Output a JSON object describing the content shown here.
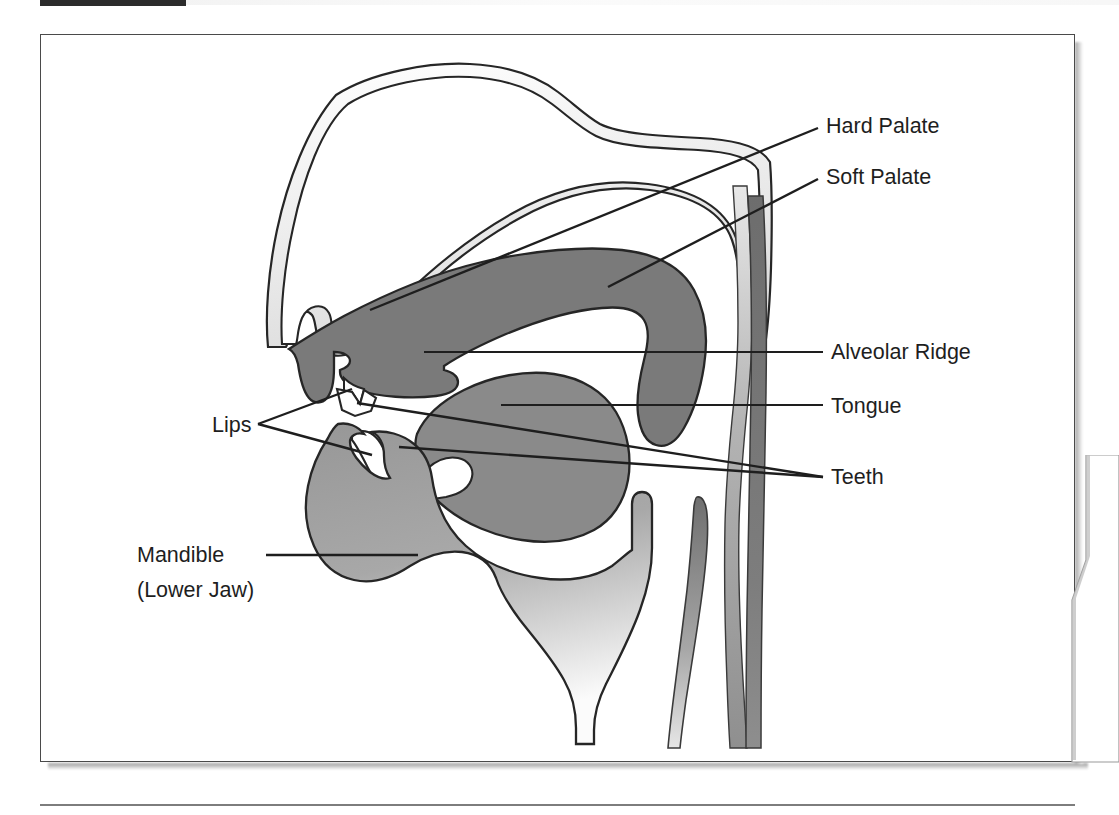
{
  "figure": {
    "kind": "anatomical-diagram"
  },
  "marker_bar": {
    "present": true,
    "color": "#2b2b2b"
  },
  "colors": {
    "outline": "#262626",
    "palate_dark_gray": "#7a7a7a",
    "tongue_gray": "#8a8a8a",
    "mandible_gray": "#9e9e9e",
    "nasal_light_gray": "#e2e2e2",
    "pharynx_gray": "#a8a8a8",
    "label_text": "#1e1e1e",
    "frame": "#4a4a4a",
    "page_background": "#ffffff"
  },
  "labels": [
    {
      "id": "hard-palate",
      "text": "Hard Palate",
      "x": 826,
      "y": 133,
      "anchor": "start"
    },
    {
      "id": "soft-palate",
      "text": "Soft Palate",
      "x": 826,
      "y": 184,
      "anchor": "start"
    },
    {
      "id": "alveolar-ridge",
      "text": "Alveolar Ridge",
      "x": 831,
      "y": 359,
      "anchor": "start"
    },
    {
      "id": "tongue",
      "text": "Tongue",
      "x": 831,
      "y": 413,
      "anchor": "start"
    },
    {
      "id": "teeth",
      "text": "Teeth",
      "x": 831,
      "y": 484,
      "anchor": "start"
    },
    {
      "id": "lips",
      "text": "Lips",
      "x": 212,
      "y": 432,
      "anchor": "start"
    },
    {
      "id": "mandible",
      "text": "Mandible",
      "x": 137,
      "y": 562,
      "anchor": "start"
    },
    {
      "id": "mandible-sub",
      "text": "(Lower Jaw)",
      "x": 137,
      "y": 597,
      "anchor": "start"
    }
  ],
  "leader_lines": [
    {
      "id": "hard-palate-leader",
      "points": "818,128 370,310"
    },
    {
      "id": "soft-palate-leader",
      "points": "818,179 608,287"
    },
    {
      "id": "alveolar-ridge-leader",
      "points": "823,352 424,352"
    },
    {
      "id": "tongue-leader",
      "points": "823,405 501,405"
    },
    {
      "id": "teeth-leader-upper",
      "points": "823,477 357,403"
    },
    {
      "id": "teeth-leader-lower",
      "points": "823,477 399,447"
    },
    {
      "id": "lips-fork",
      "points": "258,424 295,411 352,389"
    },
    {
      "id": "lips-fork-2",
      "points": "258,424 351,444 372,455"
    },
    {
      "id": "mandible-leader",
      "points": "266,555 418,555"
    }
  ]
}
